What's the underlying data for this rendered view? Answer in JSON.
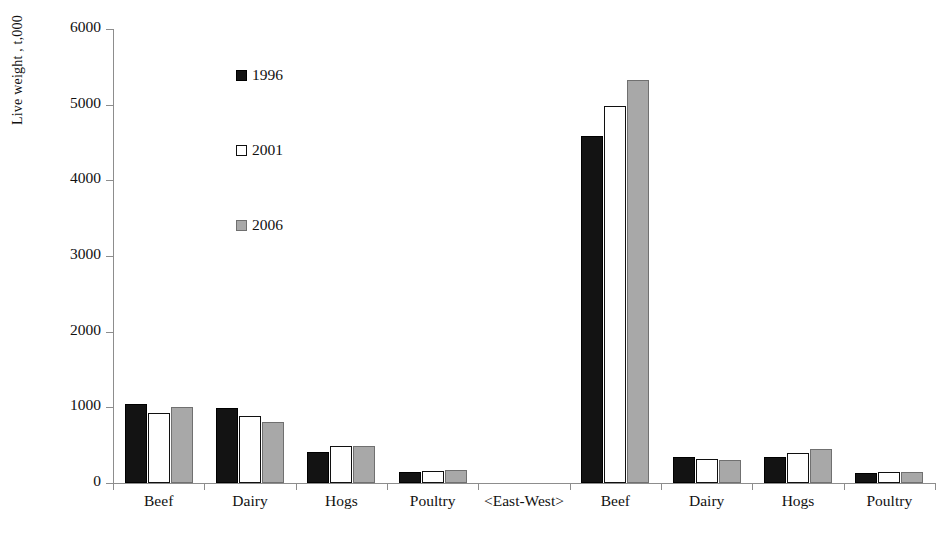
{
  "chart_data": {
    "type": "bar",
    "title": "",
    "subtitle": "",
    "xlabel": "",
    "ylabel": "Live weight , t,000",
    "ylim": [
      0,
      6000
    ],
    "ytick_labels": [
      "6000",
      "5000",
      "4000",
      "3000",
      "2000",
      "1000",
      "0"
    ],
    "yticks": [
      6000,
      5000,
      4000,
      3000,
      2000,
      1000,
      0
    ],
    "grid": false,
    "legend_position": "upper-left-inside",
    "categories": [
      "Beef",
      "Dairy",
      "Hogs",
      "Poultry",
      "<East-West>",
      "Beef",
      "Dairy",
      "Hogs",
      "Poultry"
    ],
    "series": [
      {
        "name": "1996",
        "color": "#131313",
        "values": [
          1050,
          990,
          410,
          150,
          null,
          4580,
          350,
          340,
          130
        ]
      },
      {
        "name": "2001",
        "color": "#ffffff",
        "values": [
          930,
          890,
          490,
          160,
          null,
          4980,
          320,
          400,
          150
        ]
      },
      {
        "name": "2006",
        "color": "#a8a8a8",
        "values": [
          1000,
          810,
          490,
          175,
          null,
          5320,
          300,
          450,
          145
        ]
      }
    ],
    "separator_category_index": 4,
    "annotations": []
  },
  "legend": {
    "entries": [
      {
        "label": "1996",
        "swatch": "filled-black-square"
      },
      {
        "label": "2001",
        "swatch": "open-white-square"
      },
      {
        "label": "2006",
        "swatch": "filled-gray-square"
      }
    ]
  },
  "axis": {
    "y_title": "Live weight , t,000"
  },
  "colors": {
    "series_1996": "#131313",
    "series_2001": "#ffffff",
    "series_2006": "#a8a8a8",
    "axis": "#8d8d8d",
    "text": "#111111",
    "background": "#ffffff"
  }
}
